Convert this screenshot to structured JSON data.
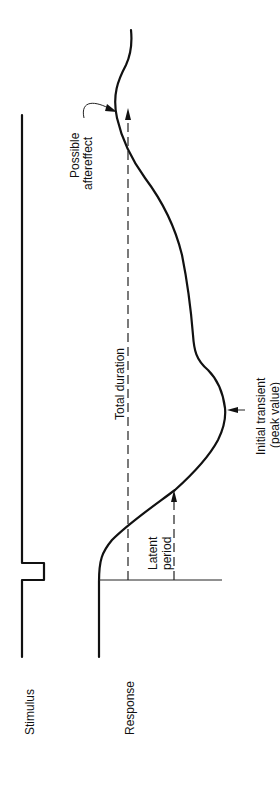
{
  "diagram": {
    "orientation": "rotated 90 degrees counter-clockwise",
    "rows": {
      "stimulus_label": "Stimulus",
      "response_label": "Response"
    },
    "annotations": {
      "latent_period": [
        "Latent",
        "period"
      ],
      "total_duration": "Total duration",
      "initial_transient": [
        "Initial transient",
        "(peak value)"
      ],
      "possible_aftereffect": [
        "Possible",
        "aftereffect"
      ]
    },
    "colors": {
      "ink": "#111111",
      "background": "#ffffff"
    }
  }
}
